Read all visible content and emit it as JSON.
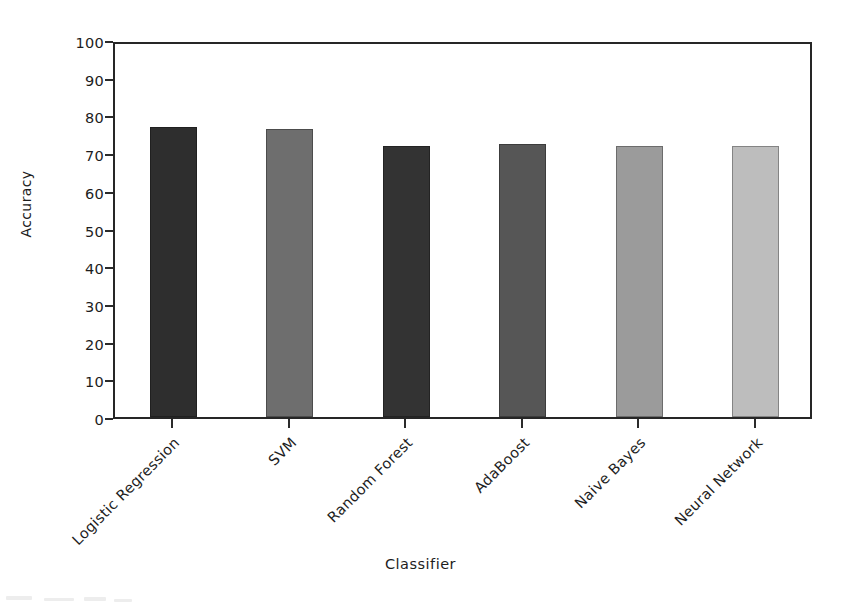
{
  "chart_data": {
    "type": "bar",
    "title": "",
    "xlabel": "Classifier",
    "ylabel": "Accuracy",
    "categories": [
      "Logistic Regression",
      "SVM",
      "Random Forest",
      "AdaBoost",
      "Naive Bayes",
      "Neural Network"
    ],
    "values": [
      77,
      76.5,
      72,
      72.5,
      72,
      72
    ],
    "bar_colors": [
      "#2e2e2e",
      "#6e6e6e",
      "#333333",
      "#565656",
      "#9b9b9b",
      "#bdbdbd"
    ],
    "ylim": [
      0,
      100
    ],
    "yticks": [
      0,
      10,
      20,
      30,
      40,
      50,
      60,
      70,
      80,
      90,
      100
    ],
    "ytick_labels": [
      "0",
      "10",
      "20",
      "30",
      "40",
      "50",
      "60",
      "70",
      "80",
      "90",
      "100"
    ],
    "grid": false,
    "legend": "none",
    "xtick_rotation": -45
  },
  "axes": {
    "y_title": "Accuracy",
    "x_title": "Classifier"
  },
  "colors": {
    "frame": "#262626",
    "text": "#1d1d1d",
    "background": "#ffffff"
  }
}
